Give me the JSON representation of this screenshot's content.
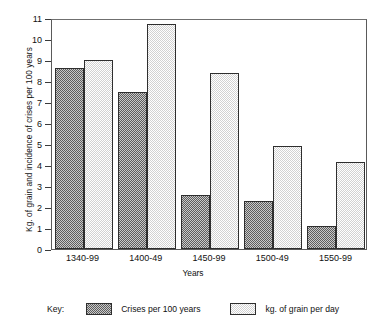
{
  "chart_data": {
    "type": "bar",
    "title": "",
    "xlabel": "Years",
    "ylabel": "Kg. of grain and incidence of crises per 100 years",
    "categories": [
      "1340-99",
      "1400-49",
      "1450-99",
      "1500-49",
      "1550-99"
    ],
    "ylim": [
      0,
      11
    ],
    "yticks": [
      0,
      1,
      2,
      3,
      4,
      5,
      6,
      7,
      8,
      9,
      10,
      11
    ],
    "ytick_labels": [
      "0",
      "1",
      "2",
      "3",
      "4",
      "5",
      "6",
      "7",
      "8",
      "9",
      "10",
      "11"
    ],
    "grid": false,
    "legend_position": "bottom",
    "series": [
      {
        "name": "Crises per 100 years",
        "swatch": "dark-dither",
        "values": [
          8.6,
          7.5,
          2.55,
          2.3,
          1.1
        ]
      },
      {
        "name": "kg. of grain per day",
        "swatch": "light-dither",
        "values": [
          9.0,
          10.7,
          8.4,
          4.9,
          4.15
        ]
      }
    ]
  },
  "legend": {
    "key_word": "Key:"
  }
}
